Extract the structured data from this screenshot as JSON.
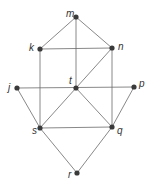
{
  "diagram": {
    "type": "graph",
    "nodes": [
      {
        "id": "m",
        "label": "m",
        "x": 76,
        "y": 17,
        "lx": 66,
        "ly": 17
      },
      {
        "id": "k",
        "label": "k",
        "x": 40,
        "y": 49,
        "lx": 29,
        "ly": 51
      },
      {
        "id": "n",
        "label": "n",
        "x": 112,
        "y": 48,
        "lx": 118,
        "ly": 50
      },
      {
        "id": "j",
        "label": "j",
        "x": 17,
        "y": 88,
        "lx": 8,
        "ly": 91
      },
      {
        "id": "t",
        "label": "t",
        "x": 76,
        "y": 88,
        "lx": 69,
        "ly": 84
      },
      {
        "id": "p",
        "label": "p",
        "x": 134,
        "y": 87,
        "lx": 139,
        "ly": 87
      },
      {
        "id": "s",
        "label": "s",
        "x": 40,
        "y": 128,
        "lx": 32,
        "ly": 134
      },
      {
        "id": "q",
        "label": "q",
        "x": 112,
        "y": 127,
        "lx": 117,
        "ly": 134
      },
      {
        "id": "r",
        "label": "r",
        "x": 77,
        "y": 173,
        "lx": 68,
        "ly": 178
      }
    ],
    "edges": [
      [
        "m",
        "k"
      ],
      [
        "m",
        "n"
      ],
      [
        "m",
        "t"
      ],
      [
        "k",
        "n"
      ],
      [
        "k",
        "s"
      ],
      [
        "n",
        "q"
      ],
      [
        "n",
        "t"
      ],
      [
        "j",
        "p"
      ],
      [
        "j",
        "s"
      ],
      [
        "t",
        "s"
      ],
      [
        "t",
        "q"
      ],
      [
        "p",
        "q"
      ],
      [
        "s",
        "q"
      ],
      [
        "s",
        "r"
      ],
      [
        "q",
        "r"
      ]
    ]
  }
}
